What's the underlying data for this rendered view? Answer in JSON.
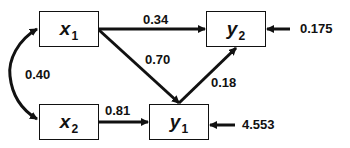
{
  "diagram": {
    "type": "path-diagram",
    "nodes": [
      {
        "id": "x1",
        "var": "x",
        "sub": "1"
      },
      {
        "id": "x2",
        "var": "x",
        "sub": "2"
      },
      {
        "id": "y1",
        "var": "y",
        "sub": "1"
      },
      {
        "id": "y2",
        "var": "y",
        "sub": "2"
      }
    ],
    "edges": [
      {
        "from": "x1",
        "to": "y2",
        "label": "0.34"
      },
      {
        "from": "x1",
        "to": "y1",
        "label": "0.70"
      },
      {
        "from": "x2",
        "to": "y1",
        "label": "0.81"
      },
      {
        "from": "y1",
        "to": "y2",
        "label": "0.18"
      },
      {
        "from": "x1",
        "to": "x2",
        "label": "0.40",
        "kind": "correlation"
      }
    ],
    "errors": [
      {
        "node": "y2",
        "label": "0.175"
      },
      {
        "node": "y1",
        "label": "4.553"
      }
    ]
  }
}
